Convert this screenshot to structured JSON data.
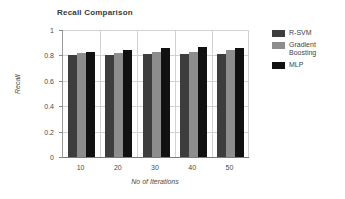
{
  "chart_data": {
    "type": "bar",
    "title": "Recall Comparison",
    "xlabel": "No of Iterations",
    "ylabel": "Recall",
    "categories": [
      "10",
      "20",
      "30",
      "40",
      "50"
    ],
    "series": [
      {
        "name": "R-SVM",
        "color": "#3d3d3d",
        "values": [
          0.8,
          0.8,
          0.81,
          0.815,
          0.815
        ]
      },
      {
        "name": "Gradient\nBoosting",
        "color": "#8d8d8d",
        "values": [
          0.82,
          0.82,
          0.83,
          0.83,
          0.84
        ]
      },
      {
        "name": "MLP",
        "color": "#111111",
        "values": [
          0.83,
          0.845,
          0.855,
          0.87,
          0.86
        ]
      }
    ],
    "ylim": [
      0,
      1
    ],
    "yticks": [
      "0",
      "0.2",
      "0.4",
      "0.6",
      "0.8",
      "1"
    ],
    "ytick_values": [
      0,
      0.2,
      0.4,
      0.6,
      0.8,
      1
    ],
    "grid": true,
    "legend_position": "right"
  },
  "legend": {
    "items": [
      {
        "label": "R-SVM"
      },
      {
        "label": "Gradient\nBoosting"
      },
      {
        "label": "MLP"
      }
    ]
  }
}
